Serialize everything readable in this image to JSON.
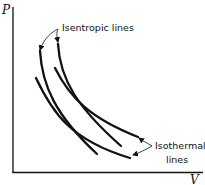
{
  "diagram": {
    "type": "pressure-volume diagram",
    "axes": {
      "y_label": "P",
      "x_label": "V"
    },
    "annotations": {
      "isentropic": "Isentropic lines",
      "isothermal_line1": "Isothermal",
      "isothermal_line2": "lines"
    },
    "curves": [
      {
        "name": "isentropic-1",
        "kind": "isentropic"
      },
      {
        "name": "isentropic-2",
        "kind": "isentropic"
      },
      {
        "name": "isothermal-1",
        "kind": "isothermal"
      },
      {
        "name": "isothermal-2",
        "kind": "isothermal"
      }
    ],
    "colors": {
      "ink": "#111111",
      "background": "#ffffff"
    }
  }
}
